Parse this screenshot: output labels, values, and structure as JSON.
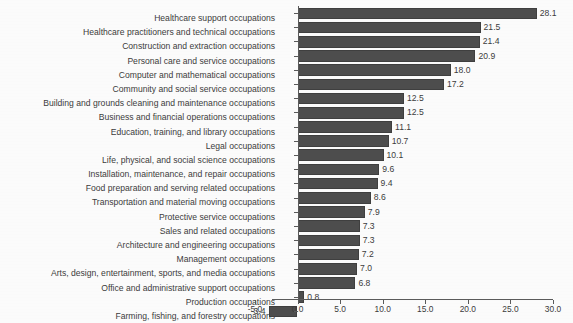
{
  "chart_data": {
    "type": "bar",
    "orientation": "horizontal",
    "title": "",
    "subtitle": "",
    "xlabel": "",
    "ylabel": "",
    "xlim": [
      -5.0,
      30.0
    ],
    "grid": false,
    "legend": null,
    "bar_color": "#4d4d4d",
    "xticks": [
      "-5.0",
      "0.0",
      "5.0",
      "10.0",
      "15.0",
      "20.0",
      "25.0",
      "30.0"
    ],
    "xtick_values": [
      -5.0,
      0.0,
      5.0,
      10.0,
      15.0,
      20.0,
      25.0,
      30.0
    ],
    "categories": [
      "Healthcare support occupations",
      "Healthcare practitioners and technical occupations",
      "Construction and extraction occupations",
      "Personal care and service occupations",
      "Computer and mathematical occupations",
      "Community and social service occupations",
      "Building and grounds cleaning and maintenance occupations",
      "Business and financial operations occupations",
      "Education, training, and library occupations",
      "Legal occupations",
      "Life, physical, and social science occupations",
      "Installation, maintenance, and repair occupations",
      "Food preparation and serving related occupations",
      "Transportation and material moving occupations",
      "Protective service occupations",
      "Sales and related occupations",
      "Architecture and engineering occupations",
      "Management occupations",
      "Arts, design, entertainment, sports, and media occupations",
      "Office and administrative support occupations",
      "Production occupations",
      "Farming, fishing, and forestry occupations"
    ],
    "values": [
      28.1,
      21.5,
      21.4,
      20.9,
      18.0,
      17.2,
      12.5,
      12.5,
      11.1,
      10.7,
      10.1,
      9.6,
      9.4,
      8.6,
      7.9,
      7.3,
      7.3,
      7.2,
      7.0,
      6.8,
      0.8,
      -3.4
    ],
    "value_labels": [
      "28.1",
      "21.5",
      "21.4",
      "20.9",
      "18.0",
      "17.2",
      "12.5",
      "12.5",
      "11.1",
      "10.7",
      "10.1",
      "9.6",
      "9.4",
      "8.6",
      "7.9",
      "7.3",
      "7.3",
      "7.2",
      "7.0",
      "6.8",
      "0.8",
      "-3.4"
    ]
  }
}
